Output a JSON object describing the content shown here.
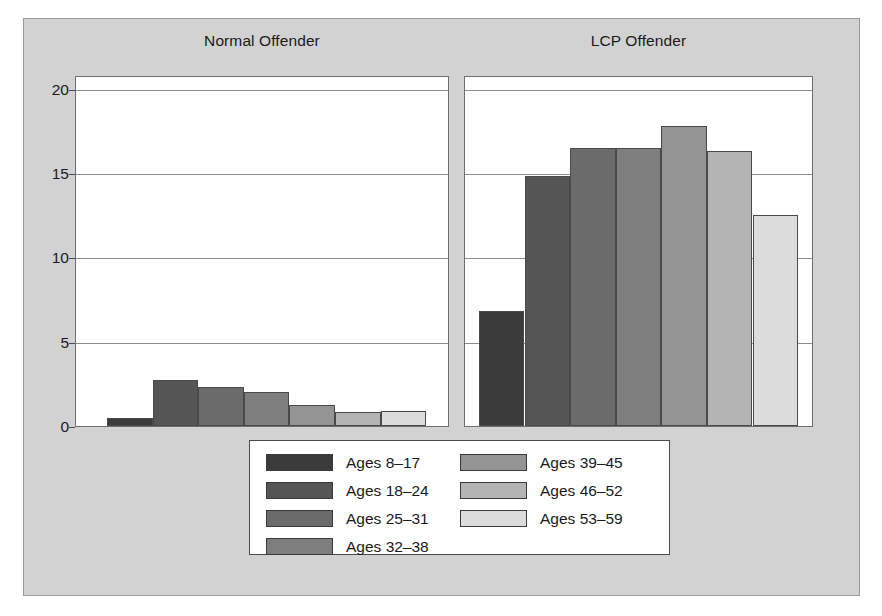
{
  "chart_data": {
    "type": "bar",
    "title": "",
    "subtitle": "",
    "xlabel": "",
    "ylabel": "",
    "ylim": [
      0,
      20.8
    ],
    "yticks": [
      0,
      5,
      10,
      15,
      20
    ],
    "ytick_labels": [
      "0",
      "5",
      "10",
      "15",
      "20"
    ],
    "grid": true,
    "legend_position": "bottom-center",
    "categories": [
      "Ages 8–17",
      "Ages 18–24",
      "Ages 25–31",
      "Ages 32–38",
      "Ages 39–45",
      "Ages 46–52",
      "Ages 53–59"
    ],
    "panels": [
      {
        "label": "Normal Offender",
        "values": [
          0.45,
          2.7,
          2.3,
          2.0,
          1.25,
          0.85,
          0.9
        ]
      },
      {
        "label": "LCP Offender",
        "values": [
          6.8,
          14.8,
          16.5,
          16.5,
          17.8,
          16.3,
          12.5
        ]
      }
    ],
    "series_colors": [
      "#3b3b3b",
      "#555555",
      "#6b6b6b",
      "#7e7e7e",
      "#949494",
      "#b4b4b4",
      "#dcdcdc"
    ]
  },
  "panels": {
    "left": {
      "title": "Normal Offender"
    },
    "right": {
      "title": "LCP Offender"
    }
  },
  "legend": {
    "column_1": [
      {
        "label": "Ages 8–17",
        "color": "#3b3b3b"
      },
      {
        "label": "Ages 18–24",
        "color": "#555555"
      },
      {
        "label": "Ages 25–31",
        "color": "#6b6b6b"
      },
      {
        "label": "Ages 32–38",
        "color": "#7e7e7e"
      }
    ],
    "column_2": [
      {
        "label": "Ages 39–45",
        "color": "#949494"
      },
      {
        "label": "Ages 46–52",
        "color": "#b4b4b4"
      },
      {
        "label": "Ages 53–59",
        "color": "#dcdcdc"
      }
    ]
  },
  "axis": {
    "ytick_labels": [
      "20",
      "15",
      "10",
      "5",
      "0"
    ]
  }
}
